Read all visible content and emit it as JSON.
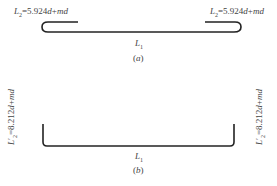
{
  "figure_a": {
    "left_label": {
      "var": "L",
      "sub": "2",
      "expr": "=5.924",
      "tail_d": "d",
      "tail": "+",
      "tail_md": "md"
    },
    "right_label": {
      "var": "L",
      "sub": "2",
      "expr": "=5.924",
      "tail_d": "d",
      "tail": "+",
      "tail_md": "md"
    },
    "length_label": {
      "var": "L",
      "sub": "1"
    },
    "caption": {
      "open": "(",
      "letter": "a",
      "close": ")"
    }
  },
  "figure_b": {
    "left_label": {
      "var": "L",
      "sub": "2",
      "prime": "′",
      "expr": "=8.212",
      "tail_d": "d",
      "tail": "+",
      "tail_md": "md"
    },
    "right_label": {
      "var": "L",
      "sub": "2",
      "prime": "′",
      "expr": "=8.212",
      "tail_d": "d",
      "tail": "+",
      "tail_md": "md"
    },
    "length_label": {
      "var": "L",
      "sub": "1"
    },
    "caption": {
      "open": "(",
      "letter": "b",
      "close": ")"
    }
  },
  "colors": {
    "stroke": "#222222",
    "text": "#444444"
  }
}
